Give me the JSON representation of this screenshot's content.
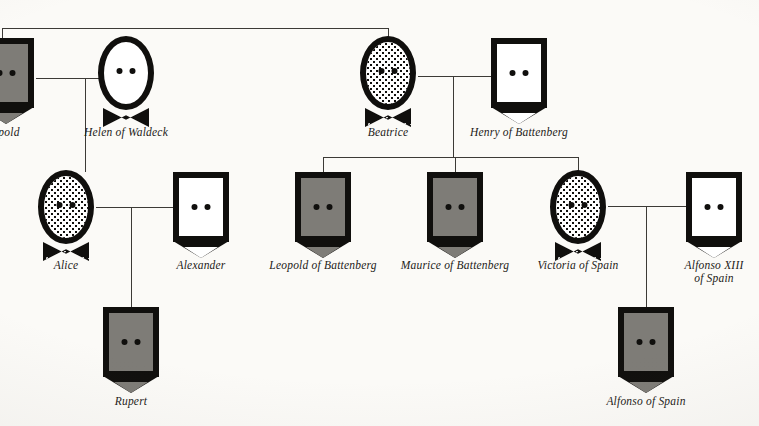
{
  "chart": {
    "type": "pedigree",
    "title": "",
    "symbol_key": {
      "male": "rectangle",
      "female": "oval",
      "affected_fill": "#7e7c77",
      "carrier_fill": "stippled",
      "unaffected_fill": "#ffffff",
      "line_color": "#3c3a36"
    }
  },
  "people": [
    {
      "id": "leopold",
      "label": "opold",
      "sex": "male",
      "status": "affected",
      "x": 6,
      "y": 38,
      "label_y": 126,
      "label_lines": [
        "opold"
      ]
    },
    {
      "id": "helen",
      "label": "Helen of Waldeck",
      "sex": "female",
      "status": "normal",
      "x": 126,
      "y": 36,
      "label_y": 126,
      "label_lines": [
        "Helen of Waldeck"
      ]
    },
    {
      "id": "beatrice",
      "label": "Beatrice",
      "sex": "female",
      "status": "carrier",
      "x": 388,
      "y": 36,
      "label_y": 126,
      "label_lines": [
        "Beatrice"
      ]
    },
    {
      "id": "henry",
      "label": "Henry of Battenberg",
      "sex": "male",
      "status": "normal",
      "x": 519,
      "y": 38,
      "label_y": 126,
      "label_lines": [
        "Henry of Battenberg"
      ]
    },
    {
      "id": "alice",
      "label": "Alice",
      "sex": "female",
      "status": "carrier",
      "x": 66,
      "y": 170,
      "label_y": 259,
      "label_lines": [
        "Alice"
      ]
    },
    {
      "id": "alexander",
      "label": "Alexander",
      "sex": "male",
      "status": "normal",
      "x": 201,
      "y": 172,
      "label_y": 259,
      "label_lines": [
        "Alexander"
      ]
    },
    {
      "id": "leopold-battenberg",
      "label": "Leopold of Battenberg",
      "sex": "male",
      "status": "affected",
      "x": 323,
      "y": 172,
      "label_y": 259,
      "label_lines": [
        "Leopold of Battenberg"
      ]
    },
    {
      "id": "maurice-battenberg",
      "label": "Maurice of Battenberg",
      "sex": "male",
      "status": "affected",
      "x": 455,
      "y": 172,
      "label_y": 259,
      "label_lines": [
        "Maurice of Battenberg"
      ]
    },
    {
      "id": "victoria-spain",
      "label": "Victoria of Spain",
      "sex": "female",
      "status": "carrier",
      "x": 578,
      "y": 170,
      "label_y": 259,
      "label_lines": [
        "Victoria of Spain"
      ]
    },
    {
      "id": "alfonso-xiii",
      "label": "Alfonso XIII of Spain",
      "sex": "male",
      "status": "normal",
      "x": 714,
      "y": 172,
      "label_y": 259,
      "label_lines": [
        "Alfonso XIII",
        "of Spain"
      ]
    },
    {
      "id": "rupert",
      "label": "Rupert",
      "sex": "male",
      "status": "affected",
      "x": 131,
      "y": 307,
      "label_y": 395,
      "label_lines": [
        "Rupert"
      ]
    },
    {
      "id": "alfonso-spain",
      "label": "Alfonso of Spain",
      "sex": "male",
      "status": "affected",
      "x": 646,
      "y": 307,
      "label_y": 395,
      "label_lines": [
        "Alfonso of Spain"
      ]
    }
  ],
  "labels": {
    "leopold": "opold",
    "helen": "Helen of Waldeck",
    "beatrice": "Beatrice",
    "henry": "Henry of Battenberg",
    "alice": "Alice",
    "alexander": "Alexander",
    "leopold_battenberg": "Leopold of Battenberg",
    "maurice_battenberg": "Maurice of Battenberg",
    "victoria_spain": "Victoria of Spain",
    "alfonso_xiii_line1": "Alfonso XIII",
    "alfonso_xiii_line2": "of Spain",
    "rupert": "Rupert",
    "alfonso_spain": "Alfonso of Spain"
  }
}
